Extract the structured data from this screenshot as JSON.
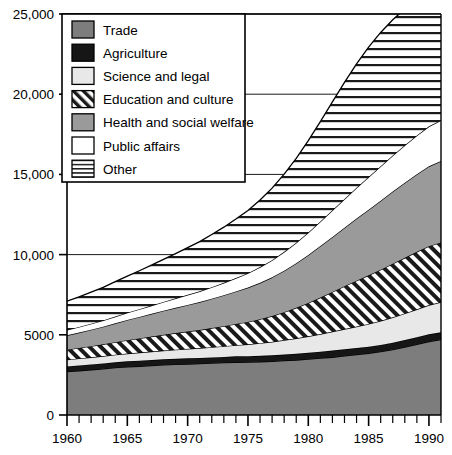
{
  "chart_data": {
    "type": "area",
    "stacked": true,
    "title": "",
    "xlabel": "",
    "ylabel": "",
    "xlim": [
      1960,
      1991
    ],
    "ylim": [
      0,
      25000
    ],
    "grid": true,
    "gridlines_y": [
      10000,
      15000,
      20000,
      25000
    ],
    "legend_position": "top-left",
    "x": [
      1960,
      1961,
      1962,
      1963,
      1964,
      1965,
      1966,
      1967,
      1968,
      1969,
      1970,
      1971,
      1972,
      1973,
      1974,
      1975,
      1976,
      1977,
      1978,
      1979,
      1980,
      1981,
      1982,
      1983,
      1984,
      1985,
      1986,
      1987,
      1988,
      1989,
      1990,
      1991
    ],
    "ytick_labels": [
      "0",
      "5000",
      "10,000",
      "15,000",
      "20,000",
      "25,000"
    ],
    "ytick_values": [
      0,
      5000,
      10000,
      15000,
      20000,
      25000
    ],
    "xtick_labels": [
      "1960",
      "1965",
      "1970",
      "1975",
      "1980",
      "1985",
      "1990"
    ],
    "xtick_values": [
      1960,
      1965,
      1970,
      1975,
      1980,
      1985,
      1990
    ],
    "xtick_minor_step": 1,
    "series": [
      {
        "name": "Trade",
        "fill": "#7d7d7d",
        "pattern": "solid",
        "values": [
          2700,
          2760,
          2820,
          2880,
          2950,
          3000,
          3040,
          3080,
          3120,
          3150,
          3180,
          3200,
          3230,
          3260,
          3290,
          3300,
          3320,
          3350,
          3390,
          3430,
          3480,
          3540,
          3600,
          3680,
          3760,
          3850,
          3950,
          4080,
          4230,
          4400,
          4580,
          4700
        ]
      },
      {
        "name": "Agriculture",
        "fill": "#161616",
        "pattern": "solid",
        "values": [
          320,
          330,
          330,
          335,
          340,
          345,
          345,
          350,
          350,
          355,
          355,
          360,
          360,
          360,
          365,
          365,
          370,
          375,
          380,
          390,
          400,
          410,
          420,
          420,
          415,
          410,
          420,
          430,
          440,
          450,
          455,
          460
        ]
      },
      {
        "name": "Science and legal",
        "fill": "#e8e8e8",
        "pattern": "solid",
        "values": [
          430,
          440,
          450,
          460,
          470,
          490,
          510,
          530,
          550,
          570,
          590,
          610,
          640,
          670,
          700,
          740,
          790,
          840,
          900,
          960,
          1030,
          1100,
          1180,
          1260,
          1340,
          1420,
          1500,
          1580,
          1660,
          1740,
          1820,
          1880
        ]
      },
      {
        "name": "Education and culture",
        "fill": "#ffffff",
        "pattern": "diagonal",
        "values": [
          620,
          650,
          690,
          730,
          780,
          830,
          880,
          930,
          980,
          1030,
          1080,
          1130,
          1190,
          1250,
          1320,
          1400,
          1490,
          1600,
          1740,
          1900,
          2080,
          2270,
          2470,
          2670,
          2860,
          3030,
          3190,
          3340,
          3470,
          3580,
          3670,
          3720
        ]
      },
      {
        "name": "Health and social welfare",
        "fill": "#9a9a9a",
        "pattern": "solid",
        "values": [
          900,
          960,
          1030,
          1100,
          1180,
          1260,
          1340,
          1420,
          1500,
          1580,
          1660,
          1740,
          1830,
          1930,
          2030,
          2140,
          2270,
          2420,
          2590,
          2780,
          2990,
          3210,
          3430,
          3650,
          3870,
          4090,
          4300,
          4500,
          4680,
          4840,
          4980,
          5080
        ]
      },
      {
        "name": "Public affairs",
        "fill": "#ffffff",
        "pattern": "solid",
        "values": [
          330,
          350,
          370,
          390,
          420,
          450,
          480,
          510,
          550,
          590,
          630,
          670,
          720,
          770,
          830,
          900,
          980,
          1070,
          1170,
          1280,
          1400,
          1530,
          1660,
          1790,
          1920,
          2040,
          2150,
          2250,
          2340,
          2420,
          2490,
          2540
        ]
      },
      {
        "name": "Other",
        "fill": "#ffffff",
        "pattern": "horizontal",
        "values": [
          1800,
          1880,
          1970,
          2060,
          2170,
          2280,
          2400,
          2520,
          2650,
          2790,
          2940,
          3100,
          3280,
          3470,
          3680,
          3910,
          4180,
          4490,
          4850,
          5260,
          5720,
          6230,
          6760,
          7270,
          7730,
          8100,
          8340,
          8460,
          8500,
          8490,
          8470,
          8460
        ]
      }
    ]
  },
  "legend": {
    "items": [
      {
        "label": "Trade",
        "swatch": "trade-swatch"
      },
      {
        "label": "Agriculture",
        "swatch": "agriculture-swatch"
      },
      {
        "label": "Science and legal",
        "swatch": "science-and-legal-swatch"
      },
      {
        "label": "Education and culture",
        "swatch": "education-and-culture-swatch"
      },
      {
        "label": "Health and social welfare",
        "swatch": "health-and-social-welfare-swatch"
      },
      {
        "label": "Public affairs",
        "swatch": "public-affairs-swatch"
      },
      {
        "label": "Other",
        "swatch": "other-swatch"
      }
    ]
  },
  "colors": {
    "trade": "#7d7d7d",
    "agriculture": "#161616",
    "science_and_legal": "#e8e8e8",
    "education_and_culture": "#ffffff",
    "health_and_social_welfare": "#9a9a9a",
    "public_affairs": "#ffffff",
    "other": "#ffffff",
    "axis": "#000000",
    "background": "#ffffff"
  }
}
